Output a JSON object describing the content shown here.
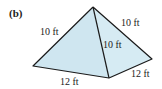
{
  "figure": {
    "part_label": "(b)",
    "shape": "pyramid",
    "fill_color": "#cfe6f0",
    "edge_color": "#1a1a1a",
    "labels": {
      "left_slant_edge": "10 ft",
      "right_slant_edge": "10 ft",
      "front_slant_edge": "10 ft",
      "front_base_edge": "12 ft",
      "right_base_edge": "12 ft"
    }
  }
}
